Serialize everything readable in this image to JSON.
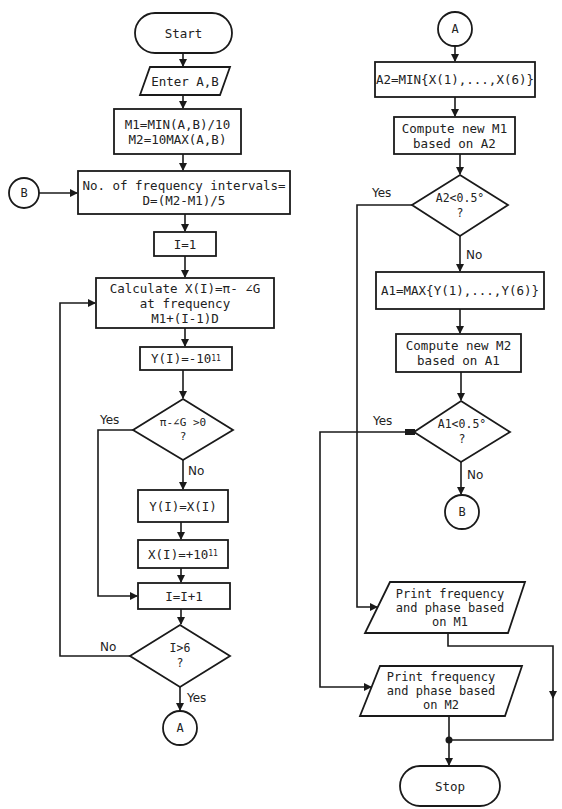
{
  "flowchart": {
    "left_column": {
      "start": "Start",
      "input": "Enter A,B",
      "init_m": [
        "M1=MIN(A,B)/10",
        "M2=10MAX(A,B)"
      ],
      "connector_b_in": "B",
      "intervals": [
        "No. of frequency intervals=",
        "D=(M2-M1)/5"
      ],
      "init_i": "I=1",
      "calculate": [
        "Calculate X(I)=π- ∠G",
        "at frequency",
        "M1+(I-1)D"
      ],
      "set_y_neg": {
        "base": "Y(I)=-10",
        "exp": "11"
      },
      "decision_phase": {
        "line1": "π-∠G >0",
        "line2": "?"
      },
      "decision_phase_yes": "Yes",
      "decision_phase_no": "No",
      "set_y_x": "Y(I)=X(I)",
      "set_x_pos": {
        "base": "X(I)=+10",
        "exp": "11"
      },
      "increment": "I=I+1",
      "decision_loop": {
        "line1": "I>6",
        "line2": "?"
      },
      "decision_loop_no": "No",
      "decision_loop_yes": "Yes",
      "connector_a_out": "A"
    },
    "right_column": {
      "connector_a_in": "A",
      "a2": "A2=MIN{X(1),...,X(6)}",
      "compute_m1": [
        "Compute new M1",
        "based on A2"
      ],
      "decision_a2": {
        "line1": "A2<0.5°",
        "line2": "?"
      },
      "decision_a2_yes": "Yes",
      "decision_a2_no": "No",
      "a1": "A1=MAX{Y(1),...,Y(6)}",
      "compute_m2": [
        "Compute new M2",
        "based on A1"
      ],
      "decision_a1": {
        "line1": "A1<0.5°",
        "line2": "?"
      },
      "decision_a1_yes": "Yes",
      "decision_a1_no": "No",
      "connector_b_out": "B",
      "print_m1": [
        "Print frequency",
        "and phase based",
        "on M1"
      ],
      "print_m2": [
        "Print frequency",
        "and phase based",
        "on M2"
      ],
      "stop": "Stop"
    }
  }
}
